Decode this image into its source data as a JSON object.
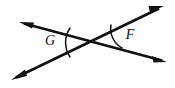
{
  "figure": {
    "background_color": "#ffffff",
    "stroke_color": "#111111",
    "width": 175,
    "height": 88
  },
  "geometry": {
    "intersection": {
      "x": 93,
      "y": 42
    },
    "lines": [
      {
        "name": "line-shallow",
        "description": "Shallow line running from upper-left to lower-right",
        "start": {
          "x": 19,
          "y": 22
        },
        "end": {
          "x": 167,
          "y": 62
        },
        "arrow_start": true,
        "arrow_end": true
      },
      {
        "name": "line-steep",
        "description": "Steeper line running from lower-left to upper-right",
        "start": {
          "x": 11,
          "y": 80
        },
        "end": {
          "x": 164,
          "y": 6
        },
        "arrow_start": true,
        "arrow_end": true
      }
    ],
    "arrowheads": [
      {
        "name": "arrow-upper-left",
        "tip": {
          "x": 19,
          "y": 22
        }
      },
      {
        "name": "arrow-lower-right",
        "tip": {
          "x": 167,
          "y": 62
        }
      },
      {
        "name": "arrow-lower-left",
        "tip": {
          "x": 11,
          "y": 80
        }
      },
      {
        "name": "arrow-upper-right",
        "tip": {
          "x": 164,
          "y": 6
        }
      }
    ]
  },
  "angles": [
    {
      "id": "angle-g",
      "label": "G",
      "position": "left",
      "type": "obtuse",
      "label_point": {
        "x": 50,
        "y": 42
      },
      "arc_path": "M 70 28 A 26 26 0 0 0 70 57",
      "description": "Angle opening to the left of the intersection"
    },
    {
      "id": "angle-f",
      "label": "F",
      "position": "right",
      "type": "obtuse",
      "label_point": {
        "x": 130,
        "y": 36
      },
      "arc_path": "M 111 25 A 22 22 0 0 0 122 48",
      "description": "Angle opening to the right of the intersection"
    }
  ]
}
